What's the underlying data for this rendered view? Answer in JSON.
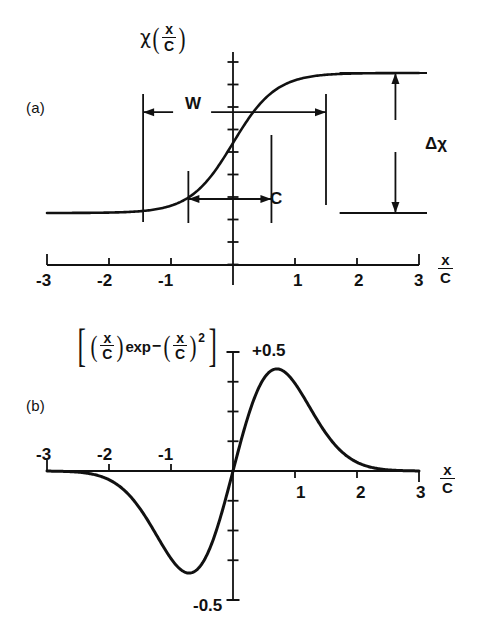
{
  "figure": {
    "title_present": false,
    "background": "#ffffff",
    "ink": "#111111"
  },
  "panel_a": {
    "tag": "(a)",
    "y_axis_label": {
      "symbol": "χ",
      "open_paren": "(",
      "numerator": "x",
      "denominator": "C",
      "close_paren": ")"
    },
    "x_axis_label": {
      "numerator": "x",
      "denominator": "C"
    },
    "x_ticks": [
      "-3",
      "-2",
      "-1",
      "1",
      "2",
      "3"
    ],
    "annotations": {
      "width_label": "W",
      "center_label": "C",
      "amplitude_label": "Δχ"
    }
  },
  "panel_b": {
    "tag": "(b)",
    "formula": {
      "open_bracket": "[",
      "open_paren1": "(",
      "num1": "x",
      "den1": "C",
      "close_paren1": ")",
      "exp_text": "exp",
      "minus": "−",
      "open_paren2": "(",
      "num2": "x",
      "den2": "C",
      "close_paren2": ")",
      "power": "2",
      "close_bracket": "]"
    },
    "x_axis_label": {
      "numerator": "x",
      "denominator": "C"
    },
    "x_ticks_negative": [
      "-3",
      "-2",
      "-1"
    ],
    "x_ticks_positive": [
      "1",
      "2",
      "3"
    ],
    "y_label_top": "+0.5",
    "y_label_bottom": "-0.5"
  },
  "chart_data": [
    {
      "type": "line",
      "panel": "(a)",
      "title": "",
      "xlabel": "x/C",
      "ylabel": "χ(x/C)",
      "xlim": [
        -3,
        3
      ],
      "ylim": [
        0,
        1
      ],
      "grid": false,
      "legend": null,
      "function": "sigmoid: 0.5*(1+tanh(x/C))",
      "xticks": [
        -3,
        -2,
        -1,
        0,
        1,
        2,
        3
      ],
      "xticklabels": [
        "-3",
        "-2",
        "-1",
        "",
        "1",
        "2",
        "3"
      ],
      "x": [
        -3.0,
        -2.75,
        -2.5,
        -2.25,
        -2.0,
        -1.75,
        -1.5,
        -1.25,
        -1.0,
        -0.75,
        -0.5,
        -0.25,
        0.0,
        0.25,
        0.5,
        0.75,
        1.0,
        1.25,
        1.5,
        1.75,
        2.0,
        2.25,
        2.5,
        2.75,
        3.0
      ],
      "y": [
        0.0025,
        0.004,
        0.0067,
        0.011,
        0.018,
        0.0293,
        0.0474,
        0.0759,
        0.1192,
        0.1824,
        0.2689,
        0.3775,
        0.5,
        0.6225,
        0.7311,
        0.8176,
        0.8808,
        0.9241,
        0.9526,
        0.9707,
        0.982,
        0.989,
        0.9933,
        0.996,
        0.9975
      ],
      "annotations": [
        {
          "label": "W",
          "type": "horizontal-double-arrow",
          "x_from": -1.45,
          "x_to": 1.5,
          "y": 0.72
        },
        {
          "label": "C",
          "type": "horizontal-double-arrow",
          "x_from": -0.72,
          "x_to": 0.62,
          "y": 0.1
        },
        {
          "label": "Δχ",
          "type": "vertical-double-arrow",
          "x": 2.6,
          "y_from": 0.0,
          "y_to": 1.0
        }
      ]
    },
    {
      "type": "line",
      "panel": "(b)",
      "title": "",
      "xlabel": "x/C",
      "ylabel": "[(x/C)exp-(x/C)^2]",
      "xlim": [
        -3,
        3
      ],
      "ylim": [
        -0.5,
        0.5
      ],
      "grid": false,
      "legend": null,
      "function": "u*exp(-u^2) with u = x/C",
      "xticks": [
        -3,
        -2,
        -1,
        0,
        1,
        2,
        3
      ],
      "xticklabels": [
        "-3",
        "-2",
        "-1",
        "",
        "1",
        "2",
        "3"
      ],
      "yticks": [
        -0.5,
        0.5
      ],
      "yticklabels": [
        "-0.5",
        "+0.5"
      ],
      "peak": {
        "x": 0.707,
        "y": 0.4289
      },
      "trough": {
        "x": -0.707,
        "y": -0.4289
      },
      "x": [
        -3.0,
        -2.75,
        -2.5,
        -2.25,
        -2.0,
        -1.75,
        -1.5,
        -1.25,
        -1.0,
        -0.85,
        -0.707,
        -0.6,
        -0.5,
        -0.35,
        -0.25,
        -0.1,
        0.0,
        0.1,
        0.25,
        0.35,
        0.5,
        0.6,
        0.707,
        0.85,
        1.0,
        1.25,
        1.5,
        1.75,
        2.0,
        2.25,
        2.5,
        2.75,
        3.0
      ],
      "y": [
        -0.00037,
        -0.00143,
        -0.00498,
        -0.01544,
        -0.03663,
        -0.08234,
        -0.15809,
        -0.26217,
        -0.36788,
        -0.41186,
        -0.42888,
        -0.41861,
        -0.3894,
        -0.30979,
        -0.2346,
        -0.099,
        0.0,
        0.099,
        0.2346,
        0.30979,
        0.3894,
        0.41861,
        0.42888,
        0.41186,
        0.36788,
        0.26217,
        0.15809,
        0.08234,
        0.03663,
        0.01544,
        0.00498,
        0.00143,
        0.00037
      ]
    }
  ]
}
